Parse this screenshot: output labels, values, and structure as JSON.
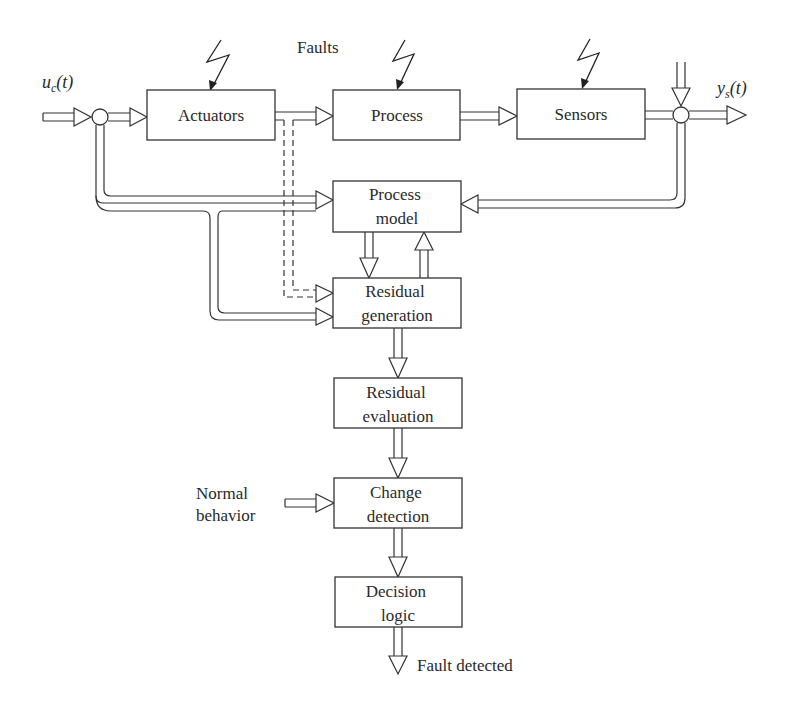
{
  "diagram": {
    "faults_label": "Faults",
    "input_signal": {
      "var": "u",
      "sub": "c",
      "arg": "(t)"
    },
    "output_signal": {
      "var": "y",
      "sub": "s",
      "arg": "(t)"
    },
    "blocks": {
      "actuators": {
        "label": "Actuators"
      },
      "process": {
        "label": "Process"
      },
      "sensors": {
        "label": "Sensors"
      },
      "process_model": {
        "line1": "Process",
        "line2": "model"
      },
      "residual_generation": {
        "line1": "Residual",
        "line2": "generation"
      },
      "residual_evaluation": {
        "line1": "Residual",
        "line2": "evaluation"
      },
      "change_detection": {
        "line1": "Change",
        "line2": "detection"
      },
      "decision_logic": {
        "line1": "Decision",
        "line2": "logic"
      }
    },
    "external_inputs": {
      "normal_behavior": {
        "line1": "Normal",
        "line2": "behavior"
      }
    },
    "outputs": {
      "fault_detected": "Fault detected"
    },
    "fault_injections": [
      "actuators",
      "process",
      "sensors"
    ],
    "connections": [
      {
        "from": "u_c(t)",
        "to": "input-junction",
        "style": "double"
      },
      {
        "from": "input-junction",
        "to": "actuators",
        "style": "double"
      },
      {
        "from": "actuators",
        "to": "process",
        "style": "double"
      },
      {
        "from": "process",
        "to": "sensors",
        "style": "double"
      },
      {
        "from": "sensors",
        "to": "output-junction",
        "style": "double"
      },
      {
        "from": "noise",
        "to": "output-junction",
        "style": "double"
      },
      {
        "from": "output-junction",
        "to": "y_s(t)",
        "style": "double"
      },
      {
        "from": "input-junction",
        "to": "process_model",
        "style": "double"
      },
      {
        "from": "input-junction",
        "to": "residual_generation",
        "style": "double"
      },
      {
        "from": "output-junction",
        "to": "process_model",
        "style": "double"
      },
      {
        "from": "actuators",
        "to": "residual_generation",
        "style": "dashed"
      },
      {
        "from": "process_model",
        "to": "residual_generation",
        "style": "double"
      },
      {
        "from": "residual_generation",
        "to": "process_model",
        "style": "double"
      },
      {
        "from": "residual_generation",
        "to": "residual_evaluation",
        "style": "double"
      },
      {
        "from": "residual_evaluation",
        "to": "change_detection",
        "style": "double"
      },
      {
        "from": "normal_behavior",
        "to": "change_detection",
        "style": "double"
      },
      {
        "from": "change_detection",
        "to": "decision_logic",
        "style": "double"
      },
      {
        "from": "decision_logic",
        "to": "fault_detected",
        "style": "double"
      }
    ],
    "colors": {
      "stroke": "#333333",
      "text": "#2a2a2a",
      "background": "#ffffff"
    }
  }
}
